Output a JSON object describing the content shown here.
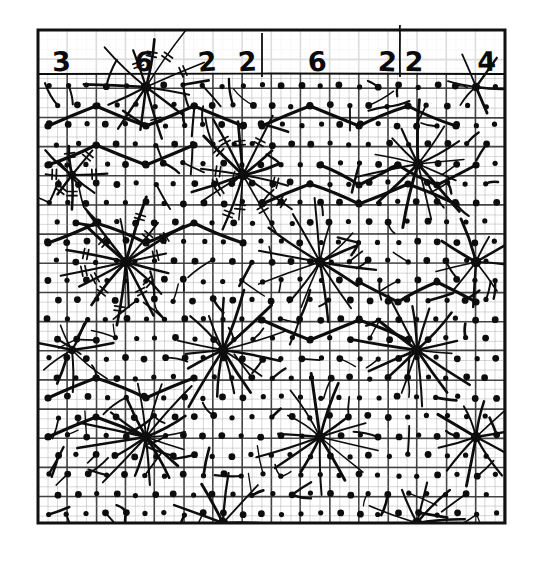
{
  "figure": {
    "kind": "hand-drawn-lattice-diagram",
    "medium": "graph-paper",
    "background_color": "#ffffff",
    "ink_color": "#0d0d0d",
    "grid_fine_color": "#9a9a9a",
    "grid_heavy_color": "#3a3a3a",
    "frame": {
      "x": 38,
      "y": 30,
      "width": 467,
      "height": 493,
      "border_width": 3,
      "border_color": "#111111"
    },
    "grid": {
      "fine_spacing": 9.72,
      "heavy_every": 3,
      "fine_line_width": 0.7,
      "heavy_line_width": 1.6,
      "columns": 48,
      "rows": 50
    },
    "header_band": {
      "height": 44,
      "digits": [
        {
          "text": "3",
          "x": 62,
          "y": 71
        },
        {
          "text": "6",
          "x": 143,
          "y": 71
        },
        {
          "text": "2",
          "x": 208,
          "y": 71
        },
        {
          "text": "2",
          "x": 248,
          "y": 71
        },
        {
          "text": "6",
          "x": 318,
          "y": 71
        },
        {
          "text": "2",
          "x": 387,
          "y": 71
        },
        {
          "text": "2",
          "x": 414,
          "y": 71
        },
        {
          "text": "4",
          "x": 487,
          "y": 71
        }
      ]
    },
    "digit_sequence": [
      3,
      6,
      2,
      2,
      6,
      2,
      2,
      4
    ],
    "digit_sum": 27,
    "vertical_rules": [
      {
        "x": 262,
        "y1": 33,
        "y2": 77
      },
      {
        "x": 400,
        "y1": 33,
        "y2": 77
      },
      {
        "x": 400,
        "y1": 25,
        "y2": 33
      }
    ],
    "lattice": {
      "description": "dots on a diagonal sublattice of the fine grid",
      "dot_radius_small": 2.6,
      "dot_radius_large": 3.4,
      "origin_x": 48,
      "origin_y": 86,
      "step": 19.45,
      "cols": 24,
      "rows": 23
    },
    "hubs": [
      {
        "id": "h1",
        "x": 146,
        "y": 87,
        "rays": 12,
        "radius": 62,
        "hatched": true,
        "size": "large"
      },
      {
        "id": "h2",
        "x": 243,
        "y": 175,
        "rays": 14,
        "radius": 58,
        "hatched": true,
        "size": "large"
      },
      {
        "id": "h3",
        "x": 418,
        "y": 164,
        "rays": 13,
        "radius": 56,
        "hatched": false,
        "size": "large"
      },
      {
        "id": "h4",
        "x": 126,
        "y": 262,
        "rays": 16,
        "radius": 64,
        "hatched": true,
        "size": "large"
      },
      {
        "id": "h5",
        "x": 320,
        "y": 262,
        "rays": 14,
        "radius": 58,
        "hatched": false,
        "size": "large"
      },
      {
        "id": "h6",
        "x": 476,
        "y": 262,
        "rays": 9,
        "radius": 44,
        "hatched": false,
        "size": "large"
      },
      {
        "id": "h7",
        "x": 223,
        "y": 350,
        "rays": 15,
        "radius": 58,
        "hatched": false,
        "size": "large"
      },
      {
        "id": "h8",
        "x": 417,
        "y": 350,
        "rays": 14,
        "radius": 56,
        "hatched": false,
        "size": "large"
      },
      {
        "id": "h9",
        "x": 72,
        "y": 350,
        "rays": 7,
        "radius": 40,
        "hatched": false,
        "size": "medium"
      },
      {
        "id": "h10",
        "x": 146,
        "y": 437,
        "rays": 16,
        "radius": 60,
        "hatched": false,
        "size": "large"
      },
      {
        "id": "h11",
        "x": 320,
        "y": 437,
        "rays": 14,
        "radius": 58,
        "hatched": false,
        "size": "large"
      },
      {
        "id": "h12",
        "x": 476,
        "y": 437,
        "rays": 10,
        "radius": 46,
        "hatched": false,
        "size": "large"
      },
      {
        "id": "h13",
        "x": 223,
        "y": 523,
        "rays": 9,
        "radius": 46,
        "hatched": false,
        "size": "large"
      },
      {
        "id": "h14",
        "x": 417,
        "y": 523,
        "rays": 9,
        "radius": 46,
        "hatched": false,
        "size": "large"
      },
      {
        "id": "h15",
        "x": 72,
        "y": 175,
        "rays": 8,
        "radius": 38,
        "hatched": true,
        "size": "medium"
      },
      {
        "id": "h16",
        "x": 476,
        "y": 87,
        "rays": 6,
        "radius": 34,
        "hatched": false,
        "size": "medium"
      }
    ],
    "zigzag_paths": [
      {
        "id": "z1",
        "points": "48,126 96,106 146,126 194,106 243,126"
      },
      {
        "id": "z2",
        "points": "48,165 96,145 146,165 194,145"
      },
      {
        "id": "z3",
        "points": "262,126 310,106 359,126 408,106 456,126"
      },
      {
        "id": "z4",
        "points": "262,204 310,184 359,204 408,184 456,204"
      },
      {
        "id": "z5",
        "points": "48,243 96,223 146,243 194,223 243,243"
      },
      {
        "id": "z6",
        "points": "320,165 359,185 398,165 437,185 476,165"
      },
      {
        "id": "z7",
        "points": "48,398 96,378 146,398 194,378"
      },
      {
        "id": "z8",
        "points": "48,437 96,417 146,437"
      },
      {
        "id": "z9",
        "points": "359,282 398,302 437,282 476,302"
      },
      {
        "id": "z10",
        "points": "262,320 310,340 359,320 408,340"
      }
    ]
  }
}
